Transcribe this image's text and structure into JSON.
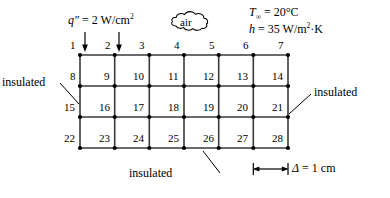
{
  "diagram": {
    "heat_flux_label": "q″ = 2 W/cm²",
    "heat_flux_symbol": "q",
    "heat_flux_prime": "″",
    "heat_flux_value": "= 2 W/cm",
    "heat_flux_exp": "2",
    "air_label": "air",
    "ambient_temp_symbol": "T",
    "ambient_temp_sub": "∞",
    "ambient_temp_value": "= 20°C",
    "conv_coeff_symbol": "h",
    "conv_coeff_value": "= 35 W/m",
    "conv_coeff_exp": "2",
    "conv_coeff_tail": "·K",
    "insulated_left": "insulated",
    "insulated_right": "insulated",
    "insulated_bottom": "insulated",
    "spacing_symbol": "Δ",
    "spacing_value": "= 1 cm",
    "grid": {
      "columns": 7,
      "rows": 4,
      "cell_width": 34.7,
      "cell_height": 31,
      "origin_x": 80,
      "origin_y": 55,
      "node_numbers": [
        [
          1,
          2,
          3,
          4,
          5,
          6,
          7
        ],
        [
          8,
          9,
          10,
          11,
          12,
          13,
          14
        ],
        [
          15,
          16,
          17,
          18,
          19,
          20,
          21
        ],
        [
          22,
          23,
          24,
          25,
          26,
          27,
          28
        ]
      ]
    },
    "flux_arrow_nodes": [
      1,
      2
    ],
    "colors": {
      "line": "#000000",
      "grid_line": "#3a3a3a",
      "background": "#ffffff",
      "text": "#000000"
    }
  }
}
